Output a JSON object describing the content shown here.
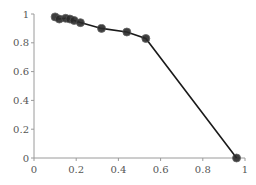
{
  "chart_data": {
    "type": "line",
    "title": "",
    "xlabel": "",
    "ylabel": "",
    "xlim": [
      0,
      1
    ],
    "ylim": [
      0,
      1
    ],
    "x_ticks": [
      0,
      0.2,
      0.4,
      0.6,
      0.8,
      1
    ],
    "y_ticks": [
      0,
      0.2,
      0.4,
      0.6,
      0.8,
      1
    ],
    "x_tick_labels": [
      "0",
      "0.2",
      "0.4",
      "0.6",
      "0.8",
      "1"
    ],
    "y_tick_labels": [
      "0",
      "0.2",
      "0.4",
      "0.6",
      "0.8",
      "1"
    ],
    "grid": false,
    "legend": null,
    "series": [
      {
        "name": "series-1",
        "color": "#1a1a1a",
        "markers": true,
        "x": [
          0.1,
          0.12,
          0.15,
          0.17,
          0.19,
          0.22,
          0.32,
          0.44,
          0.53,
          0.96
        ],
        "y": [
          0.98,
          0.965,
          0.97,
          0.965,
          0.955,
          0.94,
          0.9,
          0.875,
          0.83,
          0.0
        ]
      }
    ]
  }
}
